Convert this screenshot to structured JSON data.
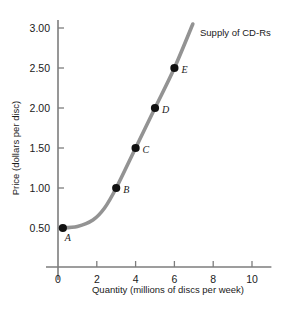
{
  "chart_data": {
    "type": "line",
    "title": "",
    "series_label": "Supply of CD-Rs",
    "xlabel": "Quantity (millions of discs per week)",
    "ylabel": "Price (dollars per disc)",
    "xlim": [
      0,
      11
    ],
    "ylim": [
      0,
      3.25
    ],
    "grid": false,
    "legend_position": "upper-right-inline",
    "xticks": [
      "0",
      "2",
      "4",
      "6",
      "8",
      "10"
    ],
    "xtick_values": [
      0,
      2,
      4,
      6,
      8,
      10
    ],
    "yticks": [
      "0.50",
      "1.00",
      "1.50",
      "2.00",
      "2.50",
      "3.00"
    ],
    "ytick_values": [
      0.5,
      1.0,
      1.5,
      2.0,
      2.5,
      3.0
    ],
    "curve_color": "#939393",
    "point_color": "#111111",
    "axis_color": "#7d7d7d",
    "points": [
      {
        "label": "A",
        "x": 0.25,
        "y": 0.5
      },
      {
        "label": "B",
        "x": 3.0,
        "y": 1.0
      },
      {
        "label": "C",
        "x": 4.0,
        "y": 1.5
      },
      {
        "label": "D",
        "x": 5.0,
        "y": 2.0
      },
      {
        "label": "E",
        "x": 6.0,
        "y": 2.5
      }
    ],
    "curve_path": [
      {
        "x": 0.1,
        "y": 0.5
      },
      {
        "x": 1.0,
        "y": 0.52
      },
      {
        "x": 1.8,
        "y": 0.6
      },
      {
        "x": 2.4,
        "y": 0.75
      },
      {
        "x": 3.0,
        "y": 1.0
      },
      {
        "x": 4.0,
        "y": 1.5
      },
      {
        "x": 5.0,
        "y": 2.0
      },
      {
        "x": 6.0,
        "y": 2.5
      },
      {
        "x": 6.95,
        "y": 3.05
      }
    ]
  }
}
